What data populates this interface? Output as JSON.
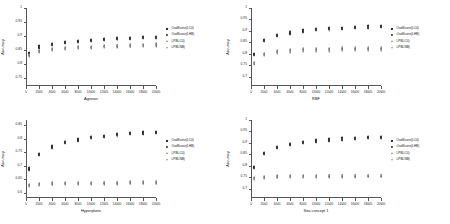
{
  "figure": {
    "panels": [
      {
        "name": "panel-agnews",
        "xlabel": "Agnews",
        "ylabel": "Accuracy",
        "yticks": [
          "0.75",
          "0.8",
          "0.85",
          "0.9",
          "0.95",
          "1"
        ],
        "ylim": [
          0.72,
          1.0
        ],
        "xticks": [
          "0",
          "2000",
          "4000",
          "6000",
          "8000",
          "10000",
          "12000",
          "14000",
          "16000",
          "18000",
          "20000"
        ],
        "xlim": [
          0,
          20000
        ],
        "legend": [
          {
            "label": "OodScore(LC0)",
            "marker": "square"
          },
          {
            "label": "OodScore(LHB)",
            "marker": "circle"
          },
          {
            "label": "LPBLC0)",
            "marker": "tri-up"
          },
          {
            "label": "LPBLNB)",
            "marker": "tri-dn"
          }
        ],
        "chart_data": {
          "type": "scatter",
          "x": [
            500,
            2000,
            4000,
            6000,
            8000,
            10000,
            12000,
            14000,
            16000,
            18000,
            20000
          ],
          "series": [
            {
              "name": "OodScore(LC0)",
              "marker": "square",
              "values": [
                0.838,
                0.862,
                0.872,
                0.878,
                0.882,
                0.886,
                0.889,
                0.891,
                0.893,
                0.895,
                0.896
              ]
            },
            {
              "name": "OodScore(LHB)",
              "marker": "circle",
              "values": [
                0.836,
                0.858,
                0.868,
                0.874,
                0.879,
                0.883,
                0.886,
                0.888,
                0.89,
                0.892,
                0.893
              ]
            },
            {
              "name": "LPBLC0)",
              "marker": "tri-up",
              "values": [
                0.832,
                0.845,
                0.852,
                0.856,
                0.859,
                0.861,
                0.863,
                0.865,
                0.866,
                0.868,
                0.869
              ]
            },
            {
              "name": "LPBLNB)",
              "marker": "tri-dn",
              "values": [
                0.83,
                0.843,
                0.849,
                0.853,
                0.856,
                0.858,
                0.86,
                0.862,
                0.863,
                0.865,
                0.866
              ]
            }
          ],
          "title": "",
          "xlabel": "Agnews",
          "ylabel": "Accuracy",
          "ylim": [
            0.72,
            1.0
          ],
          "xlim": [
            0,
            20000
          ],
          "grid": false,
          "legend_position": "right"
        }
      },
      {
        "name": "panel-rbf",
        "xlabel": "RBF",
        "ylabel": "Accuracy",
        "yticks": [
          "0.7",
          "0.75",
          "0.8",
          "0.85",
          "0.9",
          "0.95",
          "1"
        ],
        "ylim": [
          0.66,
          1.0
        ],
        "xticks": [
          "0",
          "2000",
          "4000",
          "6000",
          "8000",
          "10000",
          "12000",
          "14000",
          "16000",
          "18000",
          "20000"
        ],
        "xlim": [
          0,
          20000
        ],
        "legend": [
          {
            "label": "OodScore(LC0)",
            "marker": "square"
          },
          {
            "label": "OodScore(LHB)",
            "marker": "circle"
          },
          {
            "label": "LPBLC0)",
            "marker": "tri-up"
          },
          {
            "label": "LPBLNB)",
            "marker": "tri-dn"
          }
        ],
        "chart_data": {
          "type": "scatter",
          "x": [
            500,
            2000,
            4000,
            6000,
            8000,
            10000,
            12000,
            14000,
            16000,
            18000,
            20000
          ],
          "series": [
            {
              "name": "OodScore(LC0)",
              "marker": "square",
              "values": [
                0.8,
                0.86,
                0.882,
                0.894,
                0.902,
                0.908,
                0.912,
                0.915,
                0.918,
                0.92,
                0.922
              ]
            },
            {
              "name": "OodScore(LHB)",
              "marker": "circle",
              "values": [
                0.796,
                0.855,
                0.877,
                0.889,
                0.897,
                0.903,
                0.907,
                0.91,
                0.913,
                0.915,
                0.917
              ]
            },
            {
              "name": "LPBLC0)",
              "marker": "tri-up",
              "values": [
                0.76,
                0.8,
                0.812,
                0.818,
                0.82,
                0.822,
                0.823,
                0.824,
                0.824,
                0.825,
                0.825
              ]
            },
            {
              "name": "LPBLNB)",
              "marker": "tri-dn",
              "values": [
                0.756,
                0.795,
                0.806,
                0.811,
                0.813,
                0.814,
                0.815,
                0.816,
                0.816,
                0.817,
                0.817
              ]
            }
          ],
          "title": "",
          "xlabel": "RBF",
          "ylabel": "Accuracy",
          "ylim": [
            0.66,
            1.0
          ],
          "xlim": [
            0,
            20000
          ],
          "grid": false,
          "legend_position": "right"
        }
      },
      {
        "name": "panel-hyperplane",
        "xlabel": "Hyperplane",
        "ylabel": "Accuracy",
        "yticks": [
          "0.6",
          "0.65",
          "0.7",
          "0.75",
          "0.8",
          "0.85"
        ],
        "ylim": [
          0.58,
          0.87
        ],
        "xticks": [
          "0",
          "2000",
          "4000",
          "6000",
          "8000",
          "10000",
          "12000",
          "14000",
          "16000",
          "18000",
          "20000"
        ],
        "xlim": [
          0,
          20000
        ],
        "legend": [
          {
            "label": "OodScore(LC0)",
            "marker": "square"
          },
          {
            "label": "OodScore(LHB)",
            "marker": "circle"
          },
          {
            "label": "LPBLC0)",
            "marker": "tri-up"
          },
          {
            "label": "LPBLNB)",
            "marker": "tri-dn"
          }
        ],
        "chart_data": {
          "type": "scatter",
          "x": [
            500,
            2000,
            4000,
            6000,
            8000,
            10000,
            12000,
            14000,
            16000,
            18000,
            20000
          ],
          "series": [
            {
              "name": "OodScore(LC0)",
              "marker": "square",
              "values": [
                0.69,
                0.745,
                0.772,
                0.788,
                0.798,
                0.806,
                0.812,
                0.817,
                0.821,
                0.824,
                0.827
              ]
            },
            {
              "name": "OodScore(LHB)",
              "marker": "circle",
              "values": [
                0.686,
                0.741,
                0.768,
                0.784,
                0.794,
                0.802,
                0.808,
                0.813,
                0.817,
                0.82,
                0.823
              ]
            },
            {
              "name": "LPBLC0)",
              "marker": "tri-up",
              "values": [
                0.628,
                0.632,
                0.634,
                0.635,
                0.636,
                0.636,
                0.637,
                0.637,
                0.638,
                0.638,
                0.638
              ]
            },
            {
              "name": "LPBLNB)",
              "marker": "tri-dn",
              "values": [
                0.625,
                0.629,
                0.631,
                0.632,
                0.633,
                0.633,
                0.634,
                0.634,
                0.635,
                0.635,
                0.635
              ]
            }
          ],
          "title": "",
          "xlabel": "Hyperplane",
          "ylabel": "Accuracy",
          "ylim": [
            0.58,
            0.87
          ],
          "xlim": [
            0,
            20000
          ],
          "grid": false,
          "legend_position": "right"
        }
      },
      {
        "name": "panel-sea-concept",
        "xlabel": "Sea concept 1",
        "ylabel": "Accuracy",
        "yticks": [
          "0.7",
          "0.75",
          "0.8",
          "0.85",
          "0.9",
          "0.95",
          "1"
        ],
        "ylim": [
          0.66,
          1.0
        ],
        "xticks": [
          "0",
          "2000",
          "4000",
          "6000",
          "8000",
          "10000",
          "12000",
          "14000",
          "16000",
          "18000",
          "20000"
        ],
        "xlim": [
          0,
          20000
        ],
        "legend": [
          {
            "label": "OodScore(LC0)",
            "marker": "square"
          },
          {
            "label": "OodScore(LHB)",
            "marker": "circle"
          },
          {
            "label": "LPBLC0)",
            "marker": "tri-up"
          },
          {
            "label": "LPBLNB)",
            "marker": "tri-dn"
          }
        ],
        "chart_data": {
          "type": "scatter",
          "x": [
            500,
            2000,
            4000,
            6000,
            8000,
            10000,
            12000,
            14000,
            16000,
            18000,
            20000
          ],
          "series": [
            {
              "name": "OodScore(LC0)",
              "marker": "square",
              "values": [
                0.796,
                0.856,
                0.882,
                0.896,
                0.905,
                0.911,
                0.916,
                0.92,
                0.923,
                0.926,
                0.928
              ]
            },
            {
              "name": "OodScore(LHB)",
              "marker": "circle",
              "values": [
                0.792,
                0.851,
                0.877,
                0.891,
                0.9,
                0.906,
                0.911,
                0.915,
                0.918,
                0.921,
                0.923
              ]
            },
            {
              "name": "LPBLC0)",
              "marker": "tri-up",
              "values": [
                0.746,
                0.752,
                0.754,
                0.755,
                0.756,
                0.756,
                0.757,
                0.757,
                0.757,
                0.758,
                0.758
              ]
            },
            {
              "name": "LPBLNB)",
              "marker": "tri-dn",
              "values": [
                0.743,
                0.749,
                0.751,
                0.752,
                0.753,
                0.753,
                0.754,
                0.754,
                0.754,
                0.755,
                0.755
              ]
            }
          ],
          "title": "",
          "xlabel": "Sea concept 1",
          "ylabel": "Accuracy",
          "ylim": [
            0.66,
            1.0
          ],
          "xlim": [
            0,
            20000
          ],
          "grid": false,
          "legend_position": "right"
        }
      }
    ]
  }
}
